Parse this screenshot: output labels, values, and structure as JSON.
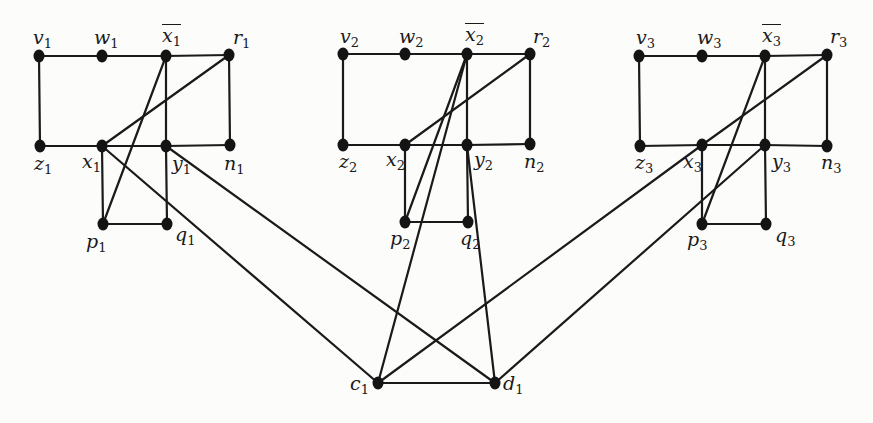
{
  "diagram": {
    "type": "graph",
    "colors": {
      "edge": "#1a1a1a",
      "node": "#141414",
      "background": "#fcfcfa"
    },
    "nodes": [
      {
        "id": "v1",
        "base": "v",
        "sub": "1",
        "x": 39,
        "y": 56,
        "lx": 33,
        "ly": 28,
        "bar": false
      },
      {
        "id": "w1",
        "base": "w",
        "sub": "1",
        "x": 102,
        "y": 56,
        "lx": 94,
        "ly": 28,
        "bar": false
      },
      {
        "id": "xbar1",
        "base": "x",
        "sub": "1",
        "x": 166,
        "y": 56,
        "lx": 162,
        "ly": 24,
        "bar": true
      },
      {
        "id": "r1",
        "base": "r",
        "sub": "1",
        "x": 229,
        "y": 55,
        "lx": 233,
        "ly": 28,
        "bar": false
      },
      {
        "id": "z1",
        "base": "z",
        "sub": "1",
        "x": 40,
        "y": 146,
        "lx": 34,
        "ly": 154,
        "bar": false
      },
      {
        "id": "x1",
        "base": "x",
        "sub": "1",
        "x": 102,
        "y": 146,
        "lx": 82,
        "ly": 152,
        "bar": false
      },
      {
        "id": "y1",
        "base": "y",
        "sub": "1",
        "x": 166,
        "y": 146,
        "lx": 172,
        "ly": 154,
        "bar": false
      },
      {
        "id": "n1",
        "base": "n",
        "sub": "1",
        "x": 230,
        "y": 145,
        "lx": 224,
        "ly": 154,
        "bar": false
      },
      {
        "id": "p1",
        "base": "p",
        "sub": "1",
        "x": 103,
        "y": 224,
        "lx": 86,
        "ly": 232,
        "bar": false
      },
      {
        "id": "q1",
        "base": "q",
        "sub": "1",
        "x": 167,
        "y": 224,
        "lx": 175,
        "ly": 225,
        "bar": false
      },
      {
        "id": "v2",
        "base": "v",
        "sub": "2",
        "x": 343,
        "y": 54,
        "lx": 340,
        "ly": 27,
        "bar": false
      },
      {
        "id": "w2",
        "base": "w",
        "sub": "2",
        "x": 405,
        "y": 54,
        "lx": 399,
        "ly": 27,
        "bar": false
      },
      {
        "id": "xbar2",
        "base": "x",
        "sub": "2",
        "x": 467,
        "y": 54,
        "lx": 465,
        "ly": 23,
        "bar": true
      },
      {
        "id": "r2",
        "base": "r",
        "sub": "2",
        "x": 530,
        "y": 54,
        "lx": 533,
        "ly": 27,
        "bar": false
      },
      {
        "id": "z2",
        "base": "z",
        "sub": "2",
        "x": 343,
        "y": 145,
        "lx": 339,
        "ly": 152,
        "bar": false
      },
      {
        "id": "x2",
        "base": "x",
        "sub": "2",
        "x": 405,
        "y": 145,
        "lx": 386,
        "ly": 150,
        "bar": false
      },
      {
        "id": "y2",
        "base": "y",
        "sub": "2",
        "x": 467,
        "y": 145,
        "lx": 474,
        "ly": 150,
        "bar": false
      },
      {
        "id": "n2",
        "base": "n",
        "sub": "2",
        "x": 530,
        "y": 144,
        "lx": 524,
        "ly": 152,
        "bar": false
      },
      {
        "id": "p2",
        "base": "p",
        "sub": "2",
        "x": 405,
        "y": 222,
        "lx": 390,
        "ly": 229,
        "bar": false
      },
      {
        "id": "q2",
        "base": "q",
        "sub": "2",
        "x": 468,
        "y": 222,
        "lx": 460,
        "ly": 229,
        "bar": false
      },
      {
        "id": "v3",
        "base": "v",
        "sub": "3",
        "x": 639,
        "y": 56,
        "lx": 636,
        "ly": 28,
        "bar": false
      },
      {
        "id": "w3",
        "base": "w",
        "sub": "3",
        "x": 702,
        "y": 56,
        "lx": 697,
        "ly": 28,
        "bar": false
      },
      {
        "id": "xbar3",
        "base": "x",
        "sub": "3",
        "x": 765,
        "y": 56,
        "lx": 762,
        "ly": 24,
        "bar": true
      },
      {
        "id": "r3",
        "base": "r",
        "sub": "3",
        "x": 827,
        "y": 55,
        "lx": 830,
        "ly": 27,
        "bar": false
      },
      {
        "id": "z3",
        "base": "z",
        "sub": "3",
        "x": 640,
        "y": 146,
        "lx": 635,
        "ly": 153,
        "bar": false
      },
      {
        "id": "x3",
        "base": "x",
        "sub": "3",
        "x": 702,
        "y": 145,
        "lx": 683,
        "ly": 152,
        "bar": false
      },
      {
        "id": "y3",
        "base": "y",
        "sub": "3",
        "x": 765,
        "y": 145,
        "lx": 772,
        "ly": 152,
        "bar": false
      },
      {
        "id": "n3",
        "base": "n",
        "sub": "3",
        "x": 827,
        "y": 146,
        "lx": 821,
        "ly": 153,
        "bar": false
      },
      {
        "id": "p3",
        "base": "p",
        "sub": "3",
        "x": 702,
        "y": 224,
        "lx": 687,
        "ly": 230,
        "bar": false
      },
      {
        "id": "q3",
        "base": "q",
        "sub": "3",
        "x": 766,
        "y": 224,
        "lx": 775,
        "ly": 226,
        "bar": false
      },
      {
        "id": "c1",
        "base": "c",
        "sub": "1",
        "x": 378,
        "y": 383,
        "lx": 350,
        "ly": 374,
        "bar": false
      },
      {
        "id": "d1",
        "base": "d",
        "sub": "1",
        "x": 495,
        "y": 383,
        "lx": 503,
        "ly": 374,
        "bar": false
      }
    ],
    "edges": [
      [
        "v1",
        "w1"
      ],
      [
        "w1",
        "xbar1"
      ],
      [
        "xbar1",
        "r1"
      ],
      [
        "v1",
        "z1"
      ],
      [
        "r1",
        "n1"
      ],
      [
        "z1",
        "x1"
      ],
      [
        "x1",
        "y1"
      ],
      [
        "y1",
        "n1"
      ],
      [
        "xbar1",
        "y1"
      ],
      [
        "x1",
        "p1"
      ],
      [
        "y1",
        "q1"
      ],
      [
        "p1",
        "q1"
      ],
      [
        "xbar1",
        "p1"
      ],
      [
        "r1",
        "x1"
      ],
      [
        "x1",
        "c1"
      ],
      [
        "y1",
        "d1"
      ],
      [
        "v2",
        "w2"
      ],
      [
        "w2",
        "xbar2"
      ],
      [
        "xbar2",
        "r2"
      ],
      [
        "v2",
        "z2"
      ],
      [
        "r2",
        "n2"
      ],
      [
        "z2",
        "x2"
      ],
      [
        "x2",
        "y2"
      ],
      [
        "y2",
        "n2"
      ],
      [
        "xbar2",
        "y2"
      ],
      [
        "x2",
        "p2"
      ],
      [
        "y2",
        "q2"
      ],
      [
        "p2",
        "q2"
      ],
      [
        "xbar2",
        "p2"
      ],
      [
        "r2",
        "x2"
      ],
      [
        "xbar2",
        "c1"
      ],
      [
        "y2",
        "d1"
      ],
      [
        "v3",
        "w3"
      ],
      [
        "w3",
        "xbar3"
      ],
      [
        "xbar3",
        "r3"
      ],
      [
        "v3",
        "z3"
      ],
      [
        "r3",
        "n3"
      ],
      [
        "z3",
        "x3"
      ],
      [
        "x3",
        "y3"
      ],
      [
        "y3",
        "n3"
      ],
      [
        "xbar3",
        "y3"
      ],
      [
        "x3",
        "p3"
      ],
      [
        "y3",
        "q3"
      ],
      [
        "p3",
        "q3"
      ],
      [
        "xbar3",
        "p3"
      ],
      [
        "r3",
        "x3"
      ],
      [
        "x3",
        "c1"
      ],
      [
        "y3",
        "d1"
      ],
      [
        "c1",
        "d1"
      ]
    ]
  }
}
